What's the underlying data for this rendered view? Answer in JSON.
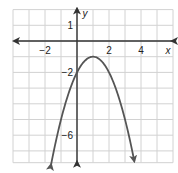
{
  "chart_data": {
    "type": "line",
    "title": "",
    "xlabel": "x",
    "ylabel": "y",
    "xlim": [
      -4,
      6
    ],
    "ylim": [
      -7.75,
      2
    ],
    "grid": true,
    "x_tick_labels": [
      "−2",
      "2",
      "4"
    ],
    "x_tick_values": [
      -2,
      2,
      4
    ],
    "y_tick_labels": [
      "1",
      "−2",
      "−6"
    ],
    "y_tick_values": [
      1,
      -2,
      -6
    ],
    "series": [
      {
        "name": "parabola",
        "equation": "y = -(x - 1)^2 - 1",
        "vertex": [
          1,
          -1
        ],
        "y_intercept": -2,
        "x": [
          -1.75,
          -1.5,
          -1,
          -0.5,
          0,
          0.5,
          1,
          1.5,
          2,
          2.5,
          3,
          3.5,
          3.75
        ],
        "y": [
          -8.56,
          -7.25,
          -5,
          -3.25,
          -2,
          -1.25,
          -1,
          -1.25,
          -2,
          -3.25,
          -5,
          -7.25,
          -8.56
        ],
        "color": "#555555",
        "arrows": "both ends"
      }
    ],
    "colors": {
      "grid": "#cfcfcf",
      "axis": "#333333",
      "curve": "#555555"
    }
  }
}
